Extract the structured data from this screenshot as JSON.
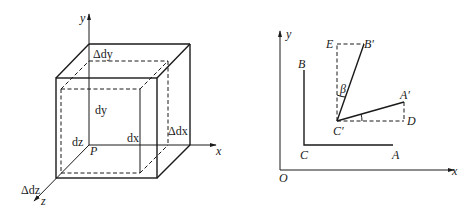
{
  "left_figure": {
    "axes": {
      "x": "x",
      "y": "y",
      "z": "z"
    },
    "origin_label": "P",
    "labels": {
      "delta_dy": "Δdy",
      "delta_dx": "Δdx",
      "delta_dz": "Δdz",
      "dx": "dx",
      "dy": "dy",
      "dz": "dz"
    }
  },
  "right_figure": {
    "axes": {
      "x": "x",
      "y": "y"
    },
    "origin_label": "O",
    "points": {
      "A": "A",
      "B": "B",
      "C": "C",
      "A_prime": "A′",
      "B_prime": "B′",
      "C_prime": "C′",
      "D": "D",
      "E": "E"
    },
    "angle_label": "β"
  },
  "colors": {
    "line": "#1a1a1a",
    "background": "#ffffff"
  }
}
